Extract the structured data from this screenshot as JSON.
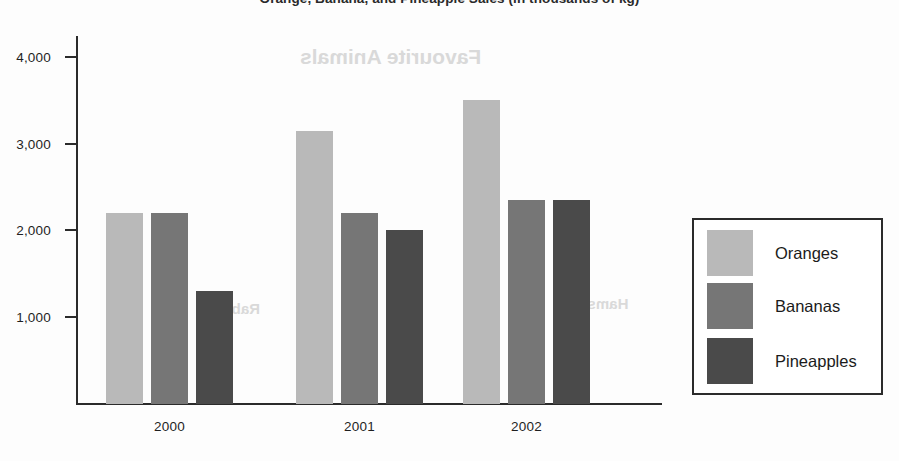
{
  "chart_data": {
    "type": "bar",
    "title": "Orange, Banana, and Pineapple Sales (in thousands of kg)",
    "xlabel": "",
    "ylabel": "",
    "categories": [
      "2000",
      "2001",
      "2002"
    ],
    "series": [
      {
        "name": "Oranges",
        "color": "#b9b9b9",
        "values": [
          2200,
          3150,
          3500
        ]
      },
      {
        "name": "Bananas",
        "color": "#767676",
        "values": [
          2200,
          2200,
          2350
        ]
      },
      {
        "name": "Pineapples",
        "color": "#4a4a4a",
        "values": [
          1300,
          2000,
          2350
        ]
      }
    ],
    "ylim": [
      0,
      4250
    ],
    "yticks": [
      1000,
      2000,
      3000,
      4000
    ],
    "ytick_labels": [
      "1,000",
      "2,000",
      "3,000",
      "4,000"
    ],
    "grid": false,
    "legend_position": "right"
  },
  "legend": {
    "entries": [
      {
        "label": "Oranges"
      },
      {
        "label": "Bananas"
      },
      {
        "label": "Pineapples"
      }
    ]
  },
  "ghost_text": {
    "heading": "Favourite Animals",
    "label_left": "Rabbits",
    "label_right": "Hamsters"
  }
}
